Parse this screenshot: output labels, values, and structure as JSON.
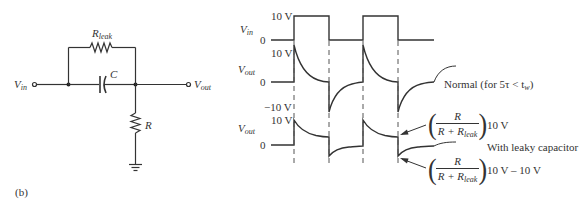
{
  "circuit": {
    "input_label": "V",
    "input_sub": "in",
    "output_label": "V",
    "output_sub": "out",
    "leak_resistor_label": "R",
    "leak_resistor_sub": "leak",
    "capacitor_label": "C",
    "resistor_label": "R",
    "figure_label": "(b)"
  },
  "waveforms": {
    "vin": {
      "label": "V",
      "sub": "in",
      "high_label": "10 V",
      "low_label": "0"
    },
    "vout_normal": {
      "label": "V",
      "sub": "out",
      "high_label": "10 V",
      "zero_label": "0",
      "low_label": "−10 V",
      "annotation": "Normal (for 5τ < t",
      "annotation_sub": "w",
      "annotation_end": ")"
    },
    "vout_leaky": {
      "label": "V",
      "sub": "out",
      "high_label": "10 V",
      "zero_label": "0",
      "annotation": "With leaky capacitor",
      "formula_top": {
        "numerator": "R",
        "denominator_main": "R + R",
        "denominator_sub": "leak",
        "suffix": "10 V"
      },
      "formula_bottom": {
        "numerator": "R",
        "denominator_main": "R + R",
        "denominator_sub": "leak",
        "suffix": "10 V – 10 V"
      }
    }
  },
  "colors": {
    "line": "#333333",
    "dashed": "#555555",
    "background": "#ffffff"
  }
}
